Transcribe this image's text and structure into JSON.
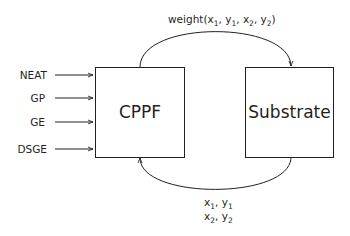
{
  "diagram": {
    "inputs": [
      {
        "label": "NEAT"
      },
      {
        "label": "GP"
      },
      {
        "label": "GE"
      },
      {
        "label": "DSGE"
      }
    ],
    "nodes": {
      "cppf": {
        "label": "CPPF"
      },
      "substrate": {
        "label": "Substrate"
      }
    },
    "edges": {
      "top": {
        "from": "CPPF",
        "to": "Substrate",
        "label_prefix": "weight(",
        "label_suffix": ")",
        "args": [
          {
            "var": "x",
            "sub": "1",
            "sep": ", "
          },
          {
            "var": "y",
            "sub": "1",
            "sep": ", "
          },
          {
            "var": "x",
            "sub": "2",
            "sep": ", "
          },
          {
            "var": "y",
            "sub": "2",
            "sep": ""
          }
        ]
      },
      "bottom": {
        "from": "Substrate",
        "to": "CPPF",
        "line1": [
          {
            "var": "x",
            "sub": "1",
            "sep": ", "
          },
          {
            "var": "y",
            "sub": "1",
            "sep": ""
          }
        ],
        "line2": [
          {
            "var": "x",
            "sub": "2",
            "sep": ", "
          },
          {
            "var": "y",
            "sub": "2",
            "sep": ""
          }
        ]
      }
    },
    "colors": {
      "stroke": "#231f20",
      "background": "#ffffff"
    }
  }
}
